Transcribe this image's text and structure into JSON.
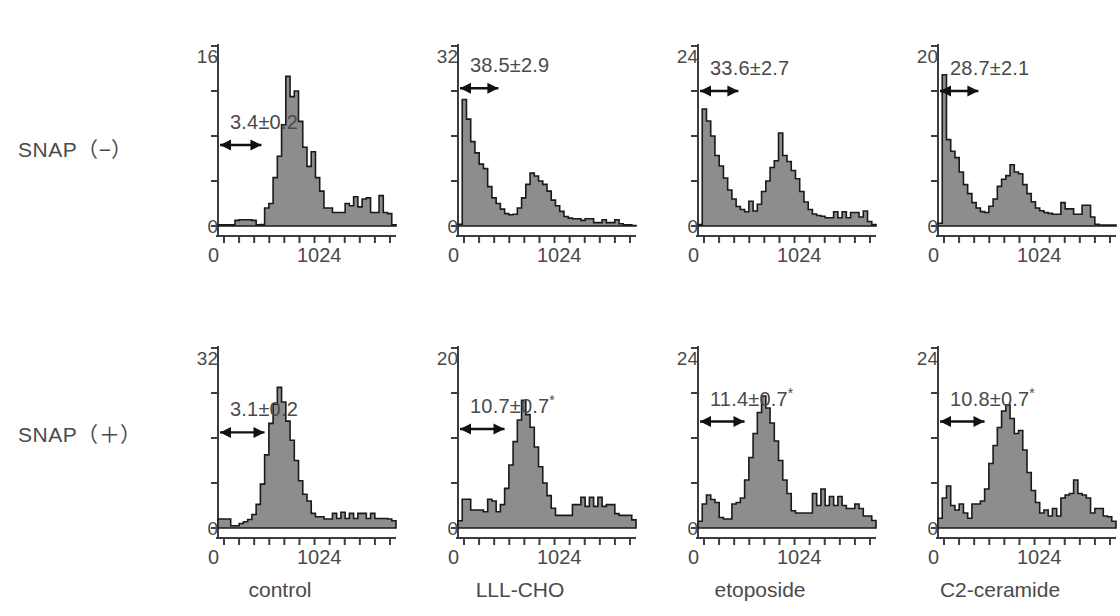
{
  "rows": [
    {
      "label": "SNAP（−）"
    },
    {
      "label": "SNAP（＋）"
    }
  ],
  "columns": [
    {
      "label": "control"
    },
    {
      "label": "LLL-CHO"
    },
    {
      "label": "etoposide"
    },
    {
      "label": "C2-ceramide"
    }
  ],
  "axis": {
    "x_min_label": "0",
    "x_max_label": "1024",
    "y_min_label": "0"
  },
  "colors": {
    "fill": "#8d8d8d",
    "stroke": "#1a1a1a",
    "axis": "#3d3d3d",
    "text": "#4a4a4a"
  },
  "chart_data": {
    "type": "bar",
    "title": "",
    "xlabel": "DNA content (channel)",
    "ylabel": "Cell number (relative)",
    "xlim": [
      0,
      1160
    ],
    "grid": false,
    "legend": "none",
    "x_tick_labels": [
      "0",
      "1024"
    ],
    "panels": [
      {
        "row": 0,
        "col": 0,
        "row_label": "SNAP（−）",
        "col_label": "control",
        "stat": "3.4±0.2",
        "stat_value": 3.4,
        "stat_error": 0.2,
        "significant": false,
        "ylim": [
          0,
          16
        ],
        "y_max_label": "16",
        "arrow_from": 0,
        "arrow_to": 270,
        "arrow_y": 7.2,
        "values": [
          0.1,
          0.1,
          0.1,
          0.1,
          0.5,
          0.55,
          0.55,
          0.55,
          0.5,
          0.1,
          0.12,
          1.6,
          2.0,
          4.3,
          6.2,
          9.0,
          13.3,
          11.5,
          12.0,
          9.3,
          7.0,
          5.3,
          6.6,
          4.3,
          3.1,
          1.6,
          1.6,
          1.2,
          1.2,
          1.2,
          2.0,
          1.8,
          2.6,
          1.7,
          2.4,
          2.5,
          1.2,
          1.2,
          2.7,
          1.2,
          1.1,
          0.1
        ]
      },
      {
        "row": 0,
        "col": 1,
        "row_label": "SNAP（−）",
        "col_label": "LLL-CHO",
        "stat": "38.5±2.9",
        "stat_value": 38.5,
        "stat_error": 2.9,
        "significant": false,
        "ylim": [
          0,
          32
        ],
        "y_max_label": "32",
        "arrow_from": 0,
        "arrow_to": 250,
        "arrow_y": 24.5,
        "values": [
          0.3,
          22.5,
          19.0,
          15.0,
          13.0,
          11.0,
          10.2,
          7.0,
          5.0,
          4.0,
          3.0,
          2.2,
          2.0,
          2.1,
          3.2,
          5.0,
          7.4,
          9.4,
          8.9,
          8.0,
          7.4,
          6.2,
          4.6,
          3.6,
          2.6,
          1.7,
          1.4,
          1.3,
          1.3,
          1.0,
          1.3,
          1.3,
          0.6,
          0.6,
          1.1,
          0.6,
          0.6,
          1.1,
          0.4,
          0.2,
          0.2,
          0.1
        ]
      },
      {
        "row": 0,
        "col": 2,
        "row_label": "SNAP（−）",
        "col_label": "etoposide",
        "stat": "33.6±2.7",
        "stat_value": 33.6,
        "stat_error": 2.7,
        "significant": false,
        "ylim": [
          0,
          24
        ],
        "y_max_label": "24",
        "arrow_from": 0,
        "arrow_to": 250,
        "arrow_y": 18.0,
        "values": [
          0.2,
          15.6,
          14.0,
          12.0,
          9.4,
          8.0,
          6.4,
          4.8,
          3.6,
          2.6,
          2.2,
          1.9,
          3.3,
          2.0,
          2.9,
          4.6,
          6.0,
          7.8,
          8.7,
          12.4,
          9.4,
          8.6,
          7.4,
          6.3,
          4.6,
          3.2,
          2.2,
          1.6,
          1.4,
          1.3,
          1.1,
          1.1,
          1.9,
          1.1,
          1.9,
          1.1,
          1.8,
          1.8,
          1.2,
          2.0,
          0.6,
          0.2
        ]
      },
      {
        "row": 0,
        "col": 3,
        "row_label": "SNAP（−）",
        "col_label": "C2-ceramide",
        "stat": "28.7±2.1",
        "stat_value": 28.7,
        "stat_error": 2.1,
        "significant": false,
        "ylim": [
          0,
          20
        ],
        "y_max_label": "20",
        "arrow_from": 0,
        "arrow_to": 250,
        "arrow_y": 15.0,
        "values": [
          0.3,
          16.8,
          9.6,
          8.3,
          7.6,
          6.0,
          4.6,
          3.6,
          2.6,
          2.0,
          1.6,
          1.5,
          2.2,
          3.0,
          4.4,
          5.2,
          5.6,
          6.8,
          6.0,
          5.8,
          4.6,
          3.6,
          2.7,
          2.0,
          1.7,
          1.5,
          1.4,
          1.3,
          1.3,
          2.6,
          1.9,
          1.9,
          1.3,
          1.3,
          2.3,
          2.3,
          1.0,
          0.2,
          0.1,
          0.1,
          0.1,
          0.1
        ]
      },
      {
        "row": 1,
        "col": 0,
        "row_label": "SNAP（＋）",
        "col_label": "control",
        "stat": "3.1±0.2",
        "stat_value": 3.1,
        "stat_error": 0.2,
        "significant": false,
        "ylim": [
          0,
          32
        ],
        "y_max_label": "32",
        "arrow_from": 0,
        "arrow_to": 290,
        "arrow_y": 17.0,
        "values": [
          1.6,
          1.6,
          1.6,
          0.4,
          0.4,
          0.8,
          1.1,
          1.5,
          2.4,
          4.2,
          7.8,
          13.0,
          18.6,
          22.0,
          25.0,
          22.4,
          19.0,
          15.6,
          12.0,
          8.4,
          6.0,
          4.8,
          2.6,
          2.0,
          2.0,
          1.6,
          1.6,
          2.6,
          1.7,
          2.8,
          1.7,
          2.6,
          1.7,
          2.6,
          2.6,
          1.7,
          2.6,
          1.7,
          1.7,
          1.7,
          1.6,
          1.3
        ]
      },
      {
        "row": 1,
        "col": 1,
        "row_label": "SNAP（＋）",
        "col_label": "LLL-CHO",
        "stat": "10.7±0.7*",
        "stat_value": 10.7,
        "stat_error": 0.7,
        "significant": true,
        "ylim": [
          0,
          20
        ],
        "y_max_label": "20",
        "arrow_from": 0,
        "arrow_to": 290,
        "arrow_y": 11.0,
        "values": [
          0.8,
          3.2,
          3.2,
          2.0,
          2.0,
          2.0,
          1.8,
          3.2,
          3.0,
          1.8,
          2.6,
          4.4,
          7.0,
          9.6,
          12.0,
          14.2,
          12.6,
          11.2,
          9.0,
          6.8,
          5.0,
          3.6,
          2.2,
          1.4,
          1.4,
          1.4,
          1.4,
          2.6,
          2.6,
          3.4,
          2.4,
          3.4,
          2.4,
          3.4,
          2.4,
          2.6,
          2.6,
          1.6,
          1.4,
          1.4,
          1.4,
          0.9
        ]
      },
      {
        "row": 1,
        "col": 2,
        "row_label": "SNAP（＋）",
        "col_label": "etoposide",
        "stat": "11.4±0.7*",
        "stat_value": 11.4,
        "stat_error": 0.7,
        "significant": true,
        "ylim": [
          0,
          24
        ],
        "y_max_label": "24",
        "arrow_from": 0,
        "arrow_to": 290,
        "arrow_y": 14.2,
        "values": [
          0.9,
          3.2,
          4.4,
          3.8,
          3.4,
          1.4,
          1.2,
          1.2,
          3.2,
          3.4,
          4.0,
          6.4,
          9.4,
          12.6,
          15.4,
          17.6,
          16.0,
          14.0,
          11.6,
          9.0,
          6.4,
          4.6,
          2.3,
          2.0,
          2.0,
          2.0,
          2.0,
          4.6,
          3.0,
          5.2,
          3.0,
          4.2,
          3.0,
          4.2,
          3.0,
          2.6,
          2.6,
          3.2,
          2.6,
          1.6,
          1.6,
          1.0
        ]
      },
      {
        "row": 1,
        "col": 3,
        "row_label": "SNAP（＋）",
        "col_label": "C2-ceramide",
        "stat": "10.8±0.7*",
        "stat_value": 10.8,
        "stat_error": 0.7,
        "significant": true,
        "ylim": [
          0,
          24
        ],
        "y_max_label": "24",
        "arrow_from": 0,
        "arrow_to": 290,
        "arrow_y": 14.2,
        "values": [
          1.3,
          4.0,
          5.6,
          3.0,
          2.4,
          3.2,
          2.0,
          1.3,
          3.2,
          3.2,
          3.6,
          5.2,
          8.6,
          11.0,
          13.4,
          15.6,
          16.4,
          14.6,
          12.6,
          13.0,
          10.4,
          7.4,
          5.0,
          3.4,
          2.0,
          2.4,
          1.6,
          2.6,
          1.6,
          4.0,
          4.4,
          4.6,
          6.4,
          4.6,
          4.4,
          4.0,
          2.0,
          2.6,
          2.6,
          1.6,
          1.5,
          0.9
        ]
      }
    ]
  }
}
